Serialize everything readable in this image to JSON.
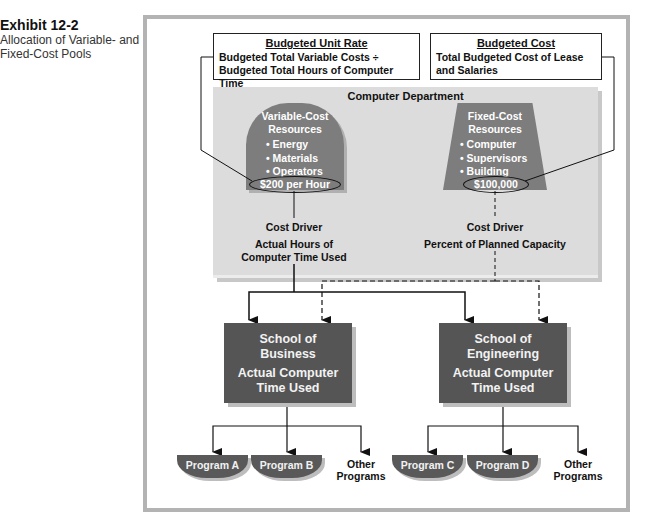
{
  "exhibit": {
    "number": "Exhibit 12-2",
    "caption": "Allocation of Variable- and Fixed-Cost Pools"
  },
  "budgeted_unit_rate": {
    "heading": "Budgeted Unit Rate",
    "text": "Budgeted Total Variable Costs ÷ Budgeted Total Hours of Computer Time"
  },
  "budgeted_cost": {
    "heading": "Budgeted Cost",
    "text": "Total Budgeted Cost of Lease and Salaries"
  },
  "department": {
    "title": "Computer Department",
    "variable": {
      "title_line1": "Variable-Cost",
      "title_line2": "Resources",
      "items": [
        "Energy",
        "Materials",
        "Operators"
      ],
      "amount": "$200 per Hour",
      "driver_label": "Cost Driver",
      "driver_line1": "Actual Hours of",
      "driver_line2": "Computer Time Used"
    },
    "fixed": {
      "title_line1": "Fixed-Cost",
      "title_line2": "Resources",
      "items": [
        "Computer",
        "Supervisors",
        "Building"
      ],
      "amount": "$100,000",
      "driver_label": "Cost Driver",
      "driver_line1": "Percent of Planned Capacity"
    }
  },
  "schools": [
    {
      "name_line1": "School of",
      "name_line2": "Business",
      "usage_line1": "Actual Computer",
      "usage_line2": "Time Used",
      "programs": [
        "Program A",
        "Program B"
      ],
      "other_line1": "Other",
      "other_line2": "Programs"
    },
    {
      "name_line1": "School of",
      "name_line2": "Engineering",
      "usage_line1": "Actual Computer",
      "usage_line2": "Time Used",
      "programs": [
        "Program C",
        "Program D"
      ],
      "other_line1": "Other",
      "other_line2": "Programs"
    }
  ],
  "colors": {
    "frame": "#b3b3b3",
    "panel": "#dcdcdc",
    "resource_shape": "#7d7d7d",
    "school_box": "#555555",
    "program_pill": "#595959"
  }
}
